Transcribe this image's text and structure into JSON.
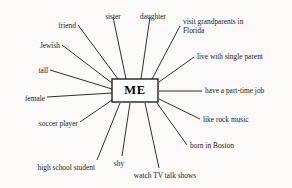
{
  "diagram": {
    "type": "mind-map",
    "title": "ME",
    "center": {
      "label": "ME",
      "x": 135,
      "y": 90.5,
      "width": 46,
      "height": 23
    },
    "background_color": "#fbfaf8",
    "line_color": "#1a1a1a",
    "text_color": "#1a1a1a",
    "nodes": [
      {
        "id": "friend",
        "label": "friend",
        "text_x": 76,
        "text_y": 22,
        "align": "end",
        "line_x1": 78,
        "line_y1": 25,
        "line_x2": 118,
        "line_y2": 79
      },
      {
        "id": "sister",
        "label": "sister",
        "text_x": 113,
        "text_y": 13,
        "align": "mid",
        "line_x1": 113,
        "line_y1": 17,
        "line_x2": 126,
        "line_y2": 79
      },
      {
        "id": "daughter",
        "label": "daughter",
        "text_x": 153,
        "text_y": 13,
        "align": "mid",
        "line_x1": 150,
        "line_y1": 17,
        "line_x2": 141,
        "line_y2": 79
      },
      {
        "id": "visit-grandparents",
        "label": "visit grandparents in\nFlorida",
        "text_x": 183,
        "text_y": 18,
        "align": "start",
        "line_x1": 180,
        "line_y1": 26,
        "line_x2": 152,
        "line_y2": 79
      },
      {
        "id": "live-with-single-parent",
        "label": "live with single parent",
        "text_x": 197,
        "text_y": 53,
        "align": "start",
        "line_x1": 194,
        "line_y1": 57,
        "line_x2": 159,
        "line_y2": 82
      },
      {
        "id": "have-part-time-job",
        "label": "have a part-time job",
        "text_x": 205,
        "text_y": 87,
        "align": "start",
        "line_x1": 202,
        "line_y1": 91,
        "line_x2": 159,
        "line_y2": 91
      },
      {
        "id": "like-rock-music",
        "label": "like rock music",
        "text_x": 203,
        "text_y": 116,
        "align": "start",
        "line_x1": 200,
        "line_y1": 119,
        "line_x2": 159,
        "line_y2": 99
      },
      {
        "id": "born-in-boston",
        "label": "born in Boston",
        "text_x": 190,
        "text_y": 142,
        "align": "start",
        "line_x1": 187,
        "line_y1": 145,
        "line_x2": 157,
        "line_y2": 103
      },
      {
        "id": "watch-tv-talk-shows",
        "label": "watch TV talk shows",
        "text_x": 165,
        "text_y": 172,
        "align": "mid",
        "line_x1": 159,
        "line_y1": 168,
        "line_x2": 145,
        "line_y2": 103
      },
      {
        "id": "shy",
        "label": "shy",
        "text_x": 119,
        "text_y": 160,
        "align": "mid",
        "line_x1": 122,
        "line_y1": 156,
        "line_x2": 130,
        "line_y2": 103
      },
      {
        "id": "high-school-student",
        "label": "high school student",
        "text_x": 95,
        "text_y": 164,
        "align": "end",
        "line_x1": 97,
        "line_y1": 160,
        "line_x2": 120,
        "line_y2": 103
      },
      {
        "id": "soccer-player",
        "label": "soccer player",
        "text_x": 78,
        "text_y": 120,
        "align": "end",
        "line_x1": 80,
        "line_y1": 122,
        "line_x2": 112,
        "line_y2": 100
      },
      {
        "id": "female",
        "label": "female",
        "text_x": 45,
        "text_y": 95,
        "align": "end",
        "line_x1": 47,
        "line_y1": 97,
        "line_x2": 112,
        "line_y2": 93
      },
      {
        "id": "tall",
        "label": "tall",
        "text_x": 48,
        "text_y": 67,
        "align": "end",
        "line_x1": 50,
        "line_y1": 70,
        "line_x2": 112,
        "line_y2": 89
      },
      {
        "id": "jewish",
        "label": "Jewish",
        "text_x": 60,
        "text_y": 42,
        "align": "end",
        "line_x1": 62,
        "line_y1": 45,
        "line_x2": 112,
        "line_y2": 83
      }
    ]
  }
}
